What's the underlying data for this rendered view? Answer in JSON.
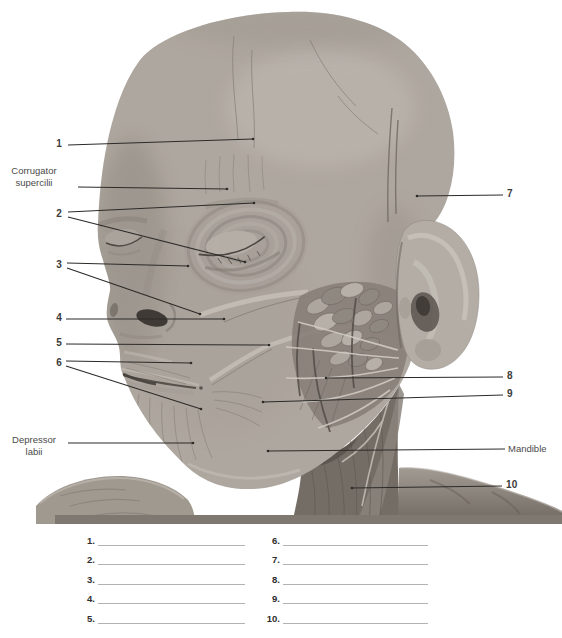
{
  "figure": {
    "colors": {
      "background": "#ffffff",
      "skin_base": "#aea79f",
      "dissection_dark": "#6b645d",
      "leader_line": "#2d2b28",
      "label_text": "#3b3b39",
      "blank_line": "#b2b2b2"
    },
    "labels": {
      "n1": "1",
      "corrugator": {
        "line1": "Corrugator",
        "line2": "supercilii"
      },
      "n2": "2",
      "n3": "3",
      "n4": "4",
      "n5": "5",
      "n6": "6",
      "depressor": {
        "line1": "Depressor",
        "line2": "labii"
      },
      "n7": "7",
      "n8": "8",
      "n9": "9",
      "mandible": "Mandible",
      "n10": "10"
    }
  },
  "worksheet": {
    "items": [
      {
        "num": "1."
      },
      {
        "num": "2."
      },
      {
        "num": "3."
      },
      {
        "num": "4."
      },
      {
        "num": "5."
      },
      {
        "num": "6."
      },
      {
        "num": "7."
      },
      {
        "num": "8."
      },
      {
        "num": "9."
      },
      {
        "num": "10."
      }
    ]
  }
}
